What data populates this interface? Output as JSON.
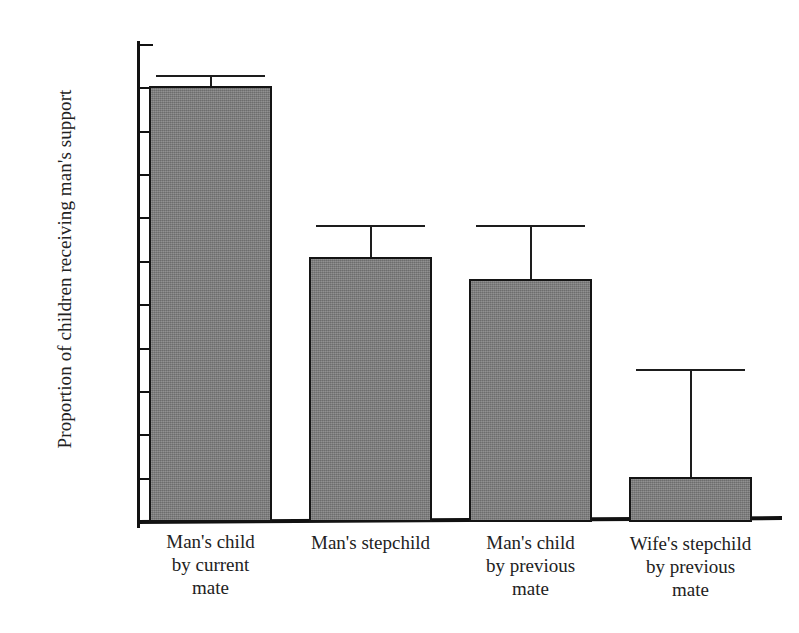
{
  "chart_data": {
    "type": "bar",
    "title": "",
    "xlabel": "",
    "ylabel": "Proportion of children receiving man's support",
    "ylim": [
      0.25,
      0.8
    ],
    "grid": false,
    "legend": null,
    "categories": [
      "Man's child by current mate",
      "Man's stepchild",
      "Man's child by previous mate",
      "Wife's stepchild by previous mate"
    ],
    "category_lines": [
      [
        "Man's child",
        "by current",
        "mate"
      ],
      [
        "Man's stepchild"
      ],
      [
        "Man's child",
        "by previous",
        "mate"
      ],
      [
        "Wife's stepchild",
        "by previous",
        "mate"
      ]
    ],
    "values": [
      0.753,
      0.556,
      0.53,
      0.302
    ],
    "error_upper": [
      0.765,
      0.592,
      0.592,
      0.426
    ],
    "ytick_labels": [
      "0.80",
      "0.75",
      "0.70",
      "0.65",
      "0.60",
      "0.55",
      "0.50",
      "0.45",
      "0.40",
      "0.35",
      "0.30",
      "0.25"
    ],
    "ytick_values": [
      0.8,
      0.75,
      0.7,
      0.65,
      0.6,
      0.55,
      0.5,
      0.45,
      0.4,
      0.35,
      0.3,
      0.25
    ],
    "bar_color": "#7a7a7a",
    "bar_edge_color": "#141414",
    "axis_color": "#111111",
    "error_bar_color": "#1d1d1d"
  }
}
